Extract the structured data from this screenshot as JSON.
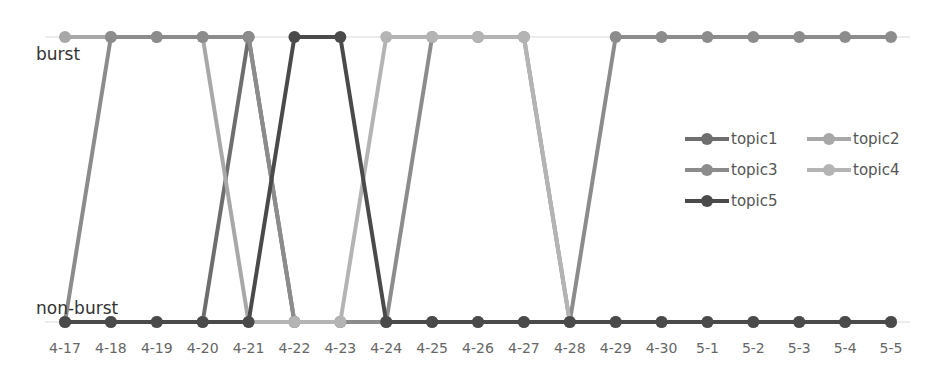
{
  "chart_data": {
    "type": "line",
    "title": "",
    "xlabel": "",
    "ylabel": "",
    "y_categories": [
      "non-burst",
      "burst"
    ],
    "categories": [
      "4-17",
      "4-18",
      "4-19",
      "4-20",
      "4-21",
      "4-22",
      "4-23",
      "4-24",
      "4-25",
      "4-26",
      "4-27",
      "4-28",
      "4-29",
      "4-30",
      "5-1",
      "5-2",
      "5-3",
      "5-4",
      "5-5"
    ],
    "series": [
      {
        "name": "topic1",
        "color": "#6e6e6e",
        "values": [
          0,
          0,
          0,
          0,
          1,
          0,
          0,
          0,
          0,
          0,
          0,
          0,
          0,
          0,
          0,
          0,
          0,
          0,
          0
        ]
      },
      {
        "name": "topic2",
        "color": "#a8a8a8",
        "values": [
          1,
          1,
          1,
          1,
          0,
          0,
          0,
          0,
          0,
          0,
          0,
          0,
          0,
          0,
          0,
          0,
          0,
          0,
          0
        ]
      },
      {
        "name": "topic3",
        "color": "#8c8c8c",
        "values": [
          0,
          1,
          1,
          1,
          1,
          0,
          0,
          0,
          1,
          1,
          1,
          0,
          1,
          1,
          1,
          1,
          1,
          1,
          1
        ]
      },
      {
        "name": "topic4",
        "color": "#b4b4b4",
        "values": [
          0,
          0,
          0,
          0,
          0,
          0,
          0,
          1,
          1,
          1,
          1,
          0,
          0,
          0,
          0,
          0,
          0,
          0,
          0
        ]
      },
      {
        "name": "topic5",
        "color": "#4a4a4a",
        "values": [
          0,
          0,
          0,
          0,
          0,
          1,
          1,
          0,
          0,
          0,
          0,
          0,
          0,
          0,
          0,
          0,
          0,
          0,
          0
        ]
      }
    ],
    "legend_position": "right",
    "grid": false
  },
  "axis": {
    "burst_label": "burst",
    "nonburst_label": "non-burst"
  },
  "legend": [
    {
      "label": "topic1"
    },
    {
      "label": "topic2"
    },
    {
      "label": "topic3"
    },
    {
      "label": "topic4"
    },
    {
      "label": "topic5"
    }
  ]
}
